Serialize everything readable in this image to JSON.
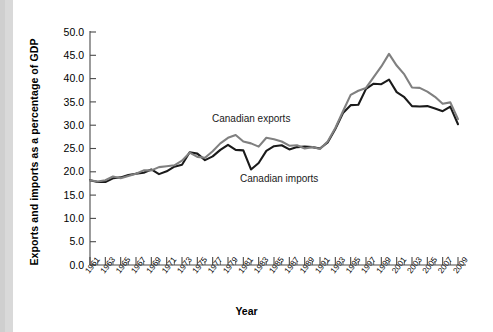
{
  "figure": {
    "background_color": "#ffffff",
    "left_strip_color": "#d9d9d9"
  },
  "axis_titles": {
    "y": "Exports and imports as a percentage of GDP",
    "x": "Year"
  },
  "annotations": [
    {
      "name": "canadian-exports-label",
      "text": "Canadian exports",
      "x": 212,
      "y": 122
    },
    {
      "name": "canadian-imports-label",
      "text": "Canadian imports",
      "x": 240,
      "y": 182
    }
  ],
  "chart_data": {
    "type": "line",
    "title": "",
    "xlabel": "Year",
    "ylabel": "Exports and imports as a percentage of GDP",
    "xlim": [
      1961,
      2009
    ],
    "ylim": [
      0,
      50
    ],
    "ytick_labels": [
      "0.0",
      "5.0",
      "10.0",
      "15.0",
      "20.0",
      "25.0",
      "30.0",
      "35.0",
      "40.0",
      "45.0",
      "50.0"
    ],
    "ytick_values": [
      0,
      5,
      10,
      15,
      20,
      25,
      30,
      35,
      40,
      45,
      50
    ],
    "xtick_labels": [
      "1961",
      "1963",
      "1965",
      "1967",
      "1969",
      "1971",
      "1973",
      "1975",
      "1977",
      "1979",
      "1981",
      "1983",
      "1985",
      "1987",
      "1989",
      "1991",
      "1993",
      "1995",
      "1997",
      "1999",
      "2001",
      "2003",
      "2005",
      "2007",
      "2009"
    ],
    "xtick_values": [
      1961,
      1963,
      1965,
      1967,
      1969,
      1971,
      1973,
      1975,
      1977,
      1979,
      1981,
      1983,
      1985,
      1987,
      1989,
      1991,
      1993,
      1995,
      1997,
      1999,
      2001,
      2003,
      2005,
      2007,
      2009
    ],
    "minor_ticks": "every year",
    "grid": false,
    "legend_position": "inline-annotations",
    "x": [
      1961,
      1962,
      1963,
      1964,
      1965,
      1966,
      1967,
      1968,
      1969,
      1970,
      1971,
      1972,
      1973,
      1974,
      1975,
      1976,
      1977,
      1978,
      1979,
      1980,
      1981,
      1982,
      1983,
      1984,
      1985,
      1986,
      1987,
      1988,
      1989,
      1990,
      1991,
      1992,
      1993,
      1994,
      1995,
      1996,
      1997,
      1998,
      1999,
      2000,
      2001,
      2002,
      2003,
      2004,
      2005,
      2006,
      2007,
      2008,
      2009
    ],
    "series": [
      {
        "name": "Canadian exports",
        "color": "#808080",
        "values": [
          18.2,
          17.9,
          18.2,
          19.0,
          18.6,
          19.1,
          19.6,
          20.3,
          20.3,
          21.0,
          21.2,
          21.4,
          22.4,
          24.1,
          23.2,
          23.0,
          24.4,
          26.1,
          27.3,
          27.9,
          26.5,
          26.1,
          25.4,
          27.3,
          27.0,
          26.5,
          25.6,
          25.7,
          25.0,
          25.3,
          24.9,
          26.5,
          29.4,
          33.0,
          36.5,
          37.4,
          38.0,
          40.3,
          42.6,
          45.3,
          42.8,
          40.9,
          38.1,
          38.0,
          37.2,
          36.1,
          34.6,
          34.9,
          31.3
        ]
      },
      {
        "name": "Canadian imports",
        "color": "#1a1a1a",
        "values": [
          18.2,
          17.8,
          17.8,
          18.6,
          18.8,
          19.3,
          19.6,
          19.8,
          20.5,
          19.5,
          20.1,
          21.1,
          21.5,
          24.2,
          23.9,
          22.5,
          23.3,
          24.7,
          25.8,
          24.7,
          24.6,
          20.5,
          21.9,
          24.5,
          25.5,
          25.7,
          24.8,
          25.3,
          25.4,
          25.3,
          25.0,
          26.3,
          29.2,
          32.6,
          34.3,
          34.4,
          37.8,
          38.9,
          38.8,
          39.8,
          37.1,
          36.0,
          34.1,
          34.0,
          34.1,
          33.6,
          33.0,
          34.0,
          30.2
        ]
      }
    ]
  }
}
